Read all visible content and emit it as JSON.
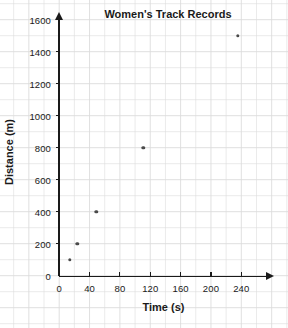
{
  "chart_data": {
    "type": "scatter",
    "title": "Women's Track Records",
    "xlabel": "Time (s)",
    "ylabel": "Distance (m)",
    "xlim": [
      0,
      276
    ],
    "ylim": [
      0,
      1700
    ],
    "xticks": [
      0,
      40,
      80,
      120,
      160,
      200,
      240
    ],
    "yticks": [
      0,
      200,
      400,
      600,
      800,
      1000,
      1200,
      1400,
      1600
    ],
    "grid": true,
    "legend": "none",
    "x": [
      14,
      24,
      49,
      111,
      235
    ],
    "y": [
      100,
      200,
      400,
      800,
      1500
    ],
    "points": [
      {
        "x": 14,
        "y": 100
      },
      {
        "x": 24,
        "y": 200
      },
      {
        "x": 49,
        "y": 400
      },
      {
        "x": 111,
        "y": 800
      },
      {
        "x": 235,
        "y": 1500
      }
    ],
    "marker_color": "#4a4a4a",
    "grid_color": "#dcdcdc",
    "axis_color": "#1a1a1a",
    "background_color": "#ffffff"
  }
}
